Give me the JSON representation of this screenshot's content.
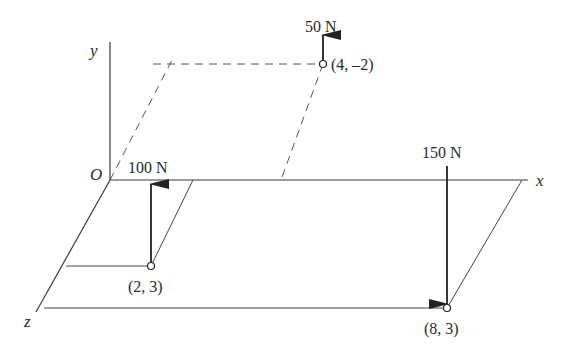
{
  "axes": {
    "x_label": "x",
    "y_label": "y",
    "z_label": "z",
    "origin_label": "O"
  },
  "forces": [
    {
      "magnitude_label": "100 N",
      "point_label": "(2, 3)",
      "direction": "up"
    },
    {
      "magnitude_label": "50 N",
      "point_label": "(4, –2)",
      "direction": "up"
    },
    {
      "magnitude_label": "150 N",
      "point_label": "(8, 3)",
      "direction": "down"
    }
  ],
  "colors": {
    "line": "#3a3a3a",
    "dashed": "#555555",
    "arrow": "#222222"
  }
}
